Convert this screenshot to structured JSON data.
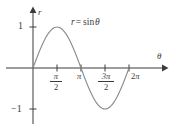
{
  "figure": {
    "name": "sine-curve-plot",
    "background_color": "#ffffff",
    "curve_color": "#8a8a8a",
    "axis_color": "#3b3b3b",
    "text_color": "#3b3b3b"
  },
  "labels": {
    "y_axis": "r",
    "x_axis": "θ",
    "equation_lhs": "r",
    "equation_op": "=",
    "equation_fn": "sin",
    "equation_arg": "θ",
    "y_tick_one": "1",
    "y_tick_neg_one": "−1",
    "x_tick_pi": "π",
    "x_tick_two_pi_coef": "2",
    "x_tick_two_pi_symbol": "π",
    "x_tick_half_pi_num": "π",
    "x_tick_half_pi_den": "2",
    "x_tick_three_half_pi_num": "3π",
    "x_tick_three_half_pi_den": "2"
  },
  "chart_data": {
    "type": "line",
    "title": "",
    "subtitle": "",
    "xlabel": "θ",
    "ylabel": "r",
    "annotations": [
      "r = sin θ"
    ],
    "legend": [],
    "legend_position": "none",
    "grid": false,
    "xlim": [
      0,
      6.8067
    ],
    "ylim": [
      -1.35,
      1.35
    ],
    "xticks": [
      1.5708,
      3.1416,
      4.7124,
      6.2832
    ],
    "xtick_labels": [
      "π/2",
      "π",
      "3π/2",
      "2π"
    ],
    "yticks": [
      1,
      -1
    ],
    "ytick_labels": [
      "1",
      "−1"
    ],
    "series": [
      {
        "name": "r = sin θ",
        "color": "#8a8a8a",
        "x": [
          0,
          0.1963,
          0.3927,
          0.589,
          0.7854,
          0.9817,
          1.1781,
          1.3744,
          1.5708,
          1.7671,
          1.9635,
          2.1598,
          2.3562,
          2.5525,
          2.7489,
          2.9452,
          3.1416,
          3.3379,
          3.5343,
          3.7306,
          3.927,
          4.1233,
          4.3197,
          4.516,
          4.7124,
          4.9087,
          5.1051,
          5.3014,
          5.4978,
          5.6941,
          5.8905,
          6.0868,
          6.2832
        ],
        "y": [
          0,
          0.1951,
          0.3827,
          0.5556,
          0.7071,
          0.8315,
          0.9239,
          0.9808,
          1,
          0.9808,
          0.9239,
          0.8315,
          0.7071,
          0.5556,
          0.3827,
          0.1951,
          0,
          -0.1951,
          -0.3827,
          -0.5556,
          -0.7071,
          -0.8315,
          -0.9239,
          -0.9808,
          -1,
          -0.9808,
          -0.9239,
          -0.8315,
          -0.7071,
          -0.5556,
          -0.3827,
          -0.1951,
          0
        ]
      }
    ]
  }
}
